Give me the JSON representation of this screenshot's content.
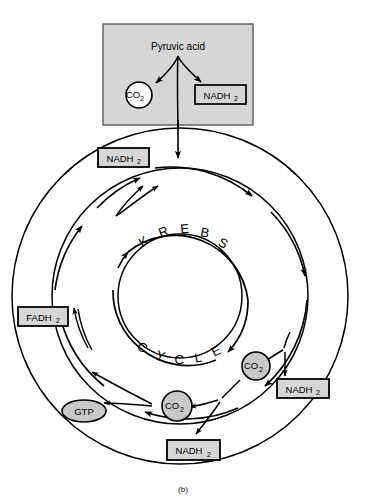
{
  "figure": {
    "caption": "(b)",
    "source_box": {
      "name": "pyruvic-acid-box",
      "label": "Pyruvic acid",
      "fill_color": "#d6d6d6",
      "border_color": "#555555",
      "products": [
        {
          "name": "co2-top",
          "label": "CO",
          "subscript": "2",
          "shape": "circle",
          "fill_color": "#ffffff"
        },
        {
          "name": "nadh2-top",
          "label": "NADH",
          "subscript": "2",
          "shape": "box",
          "fill_color": "#d6d6d6"
        }
      ]
    },
    "cycle": {
      "word_top": "K R E B S",
      "word_bottom": "C Y C L E",
      "letters_top": [
        "K",
        "R",
        "E",
        "B",
        "S"
      ],
      "letters_bottom": [
        "C",
        "Y",
        "C",
        "L",
        "E"
      ],
      "ring_color": "#000000"
    },
    "products": [
      {
        "name": "nadh2-upper-left",
        "label": "NADH",
        "subscript": "2",
        "shape": "box",
        "fill_color": "#d6d6d6"
      },
      {
        "name": "fadh2-left",
        "label": "FADH",
        "subscript": "2",
        "shape": "box",
        "fill_color": "#d6d6d6"
      },
      {
        "name": "gtp-lower-left",
        "label": "GTP",
        "subscript": "",
        "shape": "ellipse",
        "fill_color": "#c9c9c9"
      },
      {
        "name": "co2-bottom",
        "label": "CO",
        "subscript": "2",
        "shape": "circle",
        "fill_color": "#c9c9c9"
      },
      {
        "name": "nadh2-bottom",
        "label": "NADH",
        "subscript": "2",
        "shape": "box",
        "fill_color": "#d6d6d6"
      },
      {
        "name": "co2-right",
        "label": "CO",
        "subscript": "2",
        "shape": "circle",
        "fill_color": "#c9c9c9"
      },
      {
        "name": "nadh2-right",
        "label": "NADH",
        "subscript": "2",
        "shape": "box",
        "fill_color": "#d6d6d6"
      }
    ]
  }
}
